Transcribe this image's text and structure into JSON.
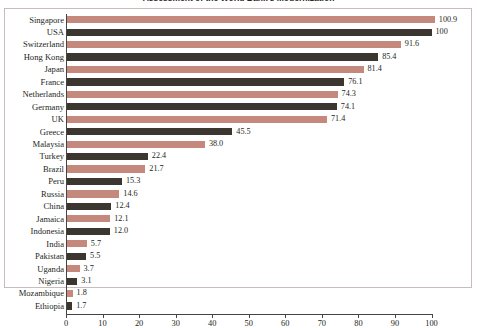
{
  "title": "Assessment of the World Bank's Modernization",
  "colors": {
    "bar_salmon": "#c4887c",
    "bar_dark": "#3b3630",
    "axis": "#4a4440",
    "frame": "#c9bcbc",
    "text": "#241f1b",
    "background": "#ffffff"
  },
  "chart_data": {
    "type": "bar",
    "orientation": "horizontal",
    "title": "Assessment of the World Bank's Modernization",
    "xlabel": "",
    "ylabel": "",
    "xlim": [
      0,
      100
    ],
    "grid": false,
    "legend": "none",
    "xticks": [
      "0",
      "10",
      "20",
      "30",
      "40",
      "50",
      "60",
      "70",
      "80",
      "90",
      "100"
    ],
    "xtick_values": [
      0,
      10,
      20,
      30,
      40,
      50,
      60,
      70,
      80,
      90,
      100
    ],
    "categories": [
      "Singapore",
      "USA",
      "Switzerland",
      "Hong Kong",
      "Japan",
      "France",
      "Netherlands",
      "Germany",
      "UK",
      "Greece",
      "Malaysia",
      "Turkey",
      "Brazil",
      "Peru",
      "Russia",
      "China",
      "Jamaica",
      "Indonesia",
      "India",
      "Pakistan",
      "Uganda",
      "Nigeria",
      "Mozambique",
      "Ethiopia"
    ],
    "values": [
      100.9,
      100,
      91.6,
      85.4,
      81.4,
      76.1,
      74.3,
      74.1,
      71.4,
      45.5,
      38.0,
      22.4,
      21.7,
      15.3,
      14.6,
      12.4,
      12.1,
      12.0,
      5.7,
      5.5,
      3.7,
      3.1,
      1.8,
      1.7
    ],
    "value_labels": [
      "100.9",
      "100",
      "91.6",
      "85.4",
      "81.4",
      "76.1",
      "74.3",
      "74.1",
      "71.4",
      "45.5",
      "38.0",
      "22.4",
      "21.7",
      "15.3",
      "14.6",
      "12.4",
      "12.1",
      "12.0",
      "5.7",
      "5.5",
      "3.7",
      "3.1",
      "1.8",
      "1.7"
    ],
    "bar_colors": [
      "#c4887c",
      "#3b3630",
      "#c4887c",
      "#3b3630",
      "#c4887c",
      "#3b3630",
      "#c4887c",
      "#3b3630",
      "#c4887c",
      "#3b3630",
      "#c4887c",
      "#3b3630",
      "#c4887c",
      "#3b3630",
      "#c4887c",
      "#3b3630",
      "#c4887c",
      "#3b3630",
      "#c4887c",
      "#3b3630",
      "#c4887c",
      "#3b3630",
      "#c4887c",
      "#3b3630"
    ]
  }
}
